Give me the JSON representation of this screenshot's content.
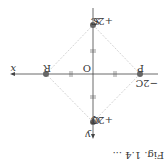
{
  "orientation": "rotated-180",
  "axes": {
    "x_label": "x",
    "y_label": "y",
    "origin_label": "O"
  },
  "charges": [
    {
      "name": "S",
      "charge": "+2C",
      "position": "top"
    },
    {
      "name": "P",
      "charge": "−2C",
      "position": "right"
    },
    {
      "name": "Q",
      "charge": "+2C",
      "position": "bottom"
    },
    {
      "name": "R",
      "charge": "",
      "position": "left"
    }
  ],
  "caption_partial": "Fig. 1.4 ...",
  "colors": {
    "axis": "#444444",
    "diamond": "#c8c8c8",
    "charge_dot": "#666666"
  }
}
